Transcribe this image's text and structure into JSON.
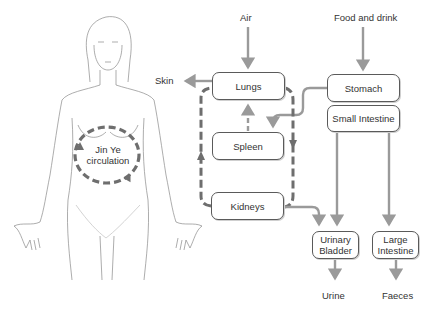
{
  "diagram": {
    "colors": {
      "arrow": "#9a9a9a",
      "dashed_loop": "#6e6e6e",
      "box_border": "#5a5a5a",
      "figure_line": "#8a8a8a",
      "text": "#333333"
    },
    "inputs": {
      "air": "Air",
      "food": "Food and drink"
    },
    "outputs": {
      "skin": "Skin",
      "urine": "Urine",
      "faeces": "Faeces"
    },
    "organs": {
      "lungs": "Lungs",
      "spleen": "Spleen",
      "kidneys": "Kidneys",
      "stomach": "Stomach",
      "small_intestine": "Small Intestine",
      "urinary_bladder_1": "Urinary",
      "urinary_bladder_2": "Bladder",
      "large_intestine_1": "Large",
      "large_intestine_2": "Intestine"
    },
    "figure": {
      "circulation_label_1": "Jin Ye",
      "circulation_label_2": "circulation"
    },
    "edges": [
      {
        "from": "Air",
        "to": "Lungs",
        "style": "solid"
      },
      {
        "from": "Lungs",
        "to": "Skin",
        "style": "solid"
      },
      {
        "from": "Food and drink",
        "to": "Stomach",
        "style": "solid"
      },
      {
        "from": "Stomach",
        "to": "Spleen",
        "style": "solid"
      },
      {
        "from": "Spleen",
        "to": "Lungs",
        "style": "dashed"
      },
      {
        "from": "Lungs",
        "to": "Kidneys",
        "style": "dashed"
      },
      {
        "from": "Kidneys",
        "to": "Lungs",
        "style": "dashed"
      },
      {
        "from": "Kidneys",
        "to": "Urinary Bladder",
        "style": "solid"
      },
      {
        "from": "Small Intestine",
        "to": "Urinary Bladder",
        "style": "solid"
      },
      {
        "from": "Small Intestine",
        "to": "Large Intestine",
        "style": "solid"
      },
      {
        "from": "Urinary Bladder",
        "to": "Urine",
        "style": "solid"
      },
      {
        "from": "Large Intestine",
        "to": "Faeces",
        "style": "solid"
      }
    ]
  }
}
